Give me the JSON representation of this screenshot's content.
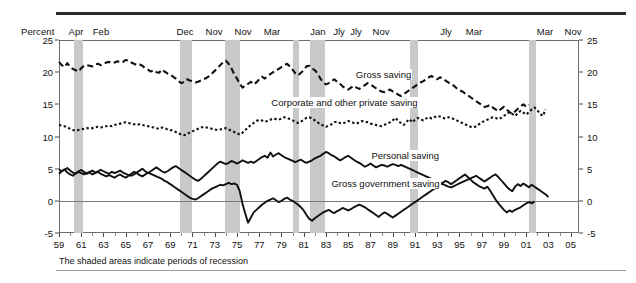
{
  "axis_label": "Percent",
  "footnote": "The shaded areas indicate periods of recession",
  "recession_tags": [
    {
      "label": "Apr",
      "x": 76
    },
    {
      "label": "Feb",
      "x": 101
    },
    {
      "label": "Dec",
      "x": 185
    },
    {
      "label": "Nov",
      "x": 214
    },
    {
      "label": "Nov",
      "x": 243
    },
    {
      "label": "Mar",
      "x": 272
    },
    {
      "label": "Jan",
      "x": 318
    },
    {
      "label": "Jly",
      "x": 339
    },
    {
      "label": "Jly",
      "x": 356
    },
    {
      "label": "Nov",
      "x": 381
    },
    {
      "label": "Jly",
      "x": 446
    },
    {
      "label": "Mar",
      "x": 474
    },
    {
      "label": "Mar",
      "x": 545
    },
    {
      "label": "Nov",
      "x": 573
    }
  ],
  "chart_data": {
    "type": "line",
    "title": "",
    "subtitle": "",
    "xlabel": "",
    "ylabel": "Percent",
    "ylim": [
      -5,
      25
    ],
    "xlim": [
      1959.0,
      2005.75
    ],
    "grid": false,
    "legend_position": "inline-annotations",
    "yticks": [
      -5,
      0,
      5,
      10,
      15,
      20,
      25
    ],
    "ytick_labels": [
      "-5",
      "0",
      "5",
      "10",
      "15",
      "20",
      "25"
    ],
    "xticks": [
      1959,
      1961,
      1963,
      1965,
      1967,
      1969,
      1971,
      1973,
      1975,
      1977,
      1979,
      1981,
      1983,
      1985,
      1987,
      1989,
      1991,
      1993,
      1995,
      1997,
      1999,
      2001,
      2003,
      2005
    ],
    "xtick_labels": [
      "59",
      "61",
      "63",
      "65",
      "67",
      "69",
      "71",
      "73",
      "75",
      "77",
      "79",
      "81",
      "83",
      "85",
      "87",
      "89",
      "91",
      "93",
      "95",
      "97",
      "99",
      "01",
      "03",
      "05"
    ],
    "recessions": [
      {
        "start": 1960.33,
        "end": 1961.12,
        "peak_month": "Apr",
        "trough_month": "Feb"
      },
      {
        "start": 1969.92,
        "end": 1970.92,
        "peak_month": "Dec",
        "trough_month": "Nov"
      },
      {
        "start": 1973.92,
        "end": 1975.25,
        "peak_month": "Nov",
        "trough_month": "Mar"
      },
      {
        "start": 1980.08,
        "end": 1980.58,
        "peak_month": "Jan",
        "trough_month": "Jly"
      },
      {
        "start": 1981.58,
        "end": 1982.92,
        "peak_month": "Jly",
        "trough_month": "Nov"
      },
      {
        "start": 1990.58,
        "end": 1991.25,
        "peak_month": "Jly",
        "trough_month": "Mar"
      },
      {
        "start": 2001.25,
        "end": 2001.92,
        "peak_month": "Mar",
        "trough_month": "Nov"
      }
    ],
    "series": [
      {
        "name": "Gross saving",
        "style": "dashed-long",
        "label_x": 1985.6,
        "label_y": 19.6,
        "x_start": 1959.0,
        "x_step": 0.25,
        "values": [
          21.6,
          21.1,
          20.8,
          21.4,
          20.8,
          20.5,
          20.3,
          20.1,
          20.6,
          21.0,
          21.1,
          21.0,
          20.9,
          21.2,
          21.3,
          21.1,
          21.3,
          21.5,
          21.6,
          21.4,
          21.5,
          21.7,
          21.5,
          21.6,
          21.9,
          21.8,
          21.5,
          21.3,
          21.1,
          21.2,
          21.0,
          20.6,
          20.4,
          20.1,
          20.3,
          20.0,
          19.9,
          20.4,
          20.1,
          19.8,
          19.6,
          19.3,
          19.0,
          18.6,
          18.3,
          18.5,
          18.9,
          18.7,
          18.6,
          18.4,
          18.5,
          18.7,
          18.9,
          19.1,
          19.4,
          19.8,
          20.2,
          20.6,
          21.1,
          21.5,
          21.8,
          21.3,
          20.6,
          19.7,
          19.0,
          18.2,
          17.6,
          17.9,
          18.2,
          18.5,
          18.1,
          18.4,
          18.9,
          19.3,
          19.0,
          19.4,
          19.7,
          20.0,
          20.3,
          20.5,
          20.8,
          21.1,
          21.3,
          20.9,
          20.4,
          19.8,
          19.5,
          19.9,
          20.3,
          20.9,
          21.0,
          20.6,
          20.3,
          19.8,
          19.0,
          18.4,
          18.1,
          18.3,
          18.6,
          18.9,
          18.5,
          18.2,
          17.8,
          17.5,
          17.3,
          17.6,
          17.9,
          17.6,
          17.4,
          17.7,
          18.0,
          18.3,
          18.1,
          17.8,
          17.5,
          17.2,
          17.0,
          16.9,
          17.1,
          17.3,
          17.0,
          16.8,
          16.5,
          16.3,
          16.6,
          16.9,
          17.2,
          17.5,
          17.8,
          18.1,
          18.4,
          18.6,
          18.9,
          19.2,
          19.4,
          19.1,
          18.9,
          19.2,
          19.0,
          18.7,
          18.4,
          18.1,
          17.9,
          17.5,
          17.2,
          17.0,
          16.7,
          16.4,
          16.1,
          15.8,
          15.5,
          15.2,
          14.9,
          14.6,
          14.7,
          14.9,
          14.5,
          14.2,
          13.9,
          14.3,
          14.6,
          14.2,
          13.8,
          13.5,
          13.9,
          14.3,
          14.7,
          15.0,
          14.6,
          14.9
        ]
      },
      {
        "name": "Corporate and other private saving",
        "style": "dotted-short",
        "label_x": 1978.0,
        "label_y": 15.2,
        "x_start": 1959.0,
        "x_step": 0.25,
        "values": [
          11.8,
          11.7,
          11.6,
          11.4,
          11.2,
          11.0,
          10.9,
          11.0,
          11.1,
          11.2,
          11.3,
          11.2,
          11.3,
          11.4,
          11.5,
          11.4,
          11.5,
          11.6,
          11.7,
          11.6,
          11.8,
          11.9,
          12.0,
          12.1,
          12.2,
          12.1,
          12.0,
          11.9,
          11.8,
          11.9,
          11.8,
          11.7,
          11.6,
          11.5,
          11.4,
          11.3,
          11.2,
          11.4,
          11.3,
          11.1,
          11.0,
          10.9,
          10.7,
          10.5,
          10.3,
          10.2,
          10.4,
          10.6,
          10.8,
          11.0,
          11.2,
          11.4,
          11.5,
          11.4,
          11.3,
          11.2,
          11.1,
          11.0,
          11.1,
          11.2,
          11.3,
          11.1,
          10.9,
          10.7,
          10.5,
          10.3,
          10.6,
          11.0,
          11.4,
          11.8,
          12.1,
          12.4,
          12.6,
          12.5,
          12.3,
          12.4,
          12.6,
          12.8,
          12.7,
          12.6,
          12.8,
          13.0,
          12.9,
          12.7,
          12.5,
          12.3,
          12.1,
          12.3,
          12.6,
          12.9,
          13.0,
          12.8,
          12.5,
          12.2,
          11.9,
          11.7,
          11.5,
          11.7,
          11.9,
          12.2,
          12.3,
          12.1,
          12.0,
          12.2,
          12.4,
          12.3,
          12.1,
          12.0,
          12.2,
          12.4,
          12.3,
          12.2,
          12.0,
          11.9,
          11.8,
          11.7,
          11.6,
          11.8,
          12.0,
          12.2,
          12.5,
          12.9,
          12.4,
          12.1,
          11.8,
          12.3,
          12.7,
          12.2,
          12.6,
          12.9,
          12.7,
          12.5,
          12.8,
          13.0,
          12.8,
          13.0,
          13.2,
          13.1,
          12.9,
          12.8,
          13.0,
          12.9,
          12.7,
          12.5,
          12.3,
          12.1,
          11.9,
          11.7,
          11.5,
          11.4,
          11.6,
          11.9,
          12.2,
          12.4,
          12.6,
          12.8,
          13.0,
          12.9,
          12.7,
          12.9,
          13.2,
          13.5,
          13.8,
          13.5,
          13.2,
          13.6,
          14.0,
          13.7,
          13.4,
          13.8,
          14.2,
          14.5,
          14.1,
          13.5,
          13.2,
          14.2
        ]
      },
      {
        "name": "Personal saving",
        "style": "solid",
        "label_x": 1987.0,
        "label_y": 6.9,
        "x_start": 1959.0,
        "x_step": 0.25,
        "values": [
          4.9,
          4.6,
          4.8,
          5.1,
          4.7,
          4.4,
          4.2,
          4.5,
          4.3,
          4.1,
          4.3,
          4.5,
          4.7,
          4.4,
          4.6,
          4.8,
          4.6,
          4.4,
          4.2,
          4.5,
          4.3,
          4.5,
          4.7,
          4.4,
          4.2,
          4.0,
          3.9,
          4.1,
          4.4,
          4.7,
          5.0,
          4.6,
          4.3,
          4.6,
          4.9,
          5.2,
          4.9,
          4.6,
          4.4,
          4.6,
          4.9,
          5.2,
          5.4,
          5.1,
          4.8,
          4.5,
          4.2,
          3.9,
          3.6,
          3.3,
          3.1,
          3.4,
          3.8,
          4.2,
          4.6,
          5.0,
          5.4,
          5.8,
          6.1,
          5.9,
          5.7,
          5.9,
          6.2,
          6.0,
          5.8,
          6.0,
          6.3,
          6.1,
          5.9,
          6.1,
          5.9,
          6.2,
          6.5,
          6.8,
          7.0,
          6.7,
          7.5,
          6.9,
          7.2,
          7.4,
          7.1,
          6.8,
          6.6,
          6.4,
          6.2,
          6.0,
          6.2,
          6.4,
          6.1,
          5.9,
          6.1,
          6.3,
          6.6,
          6.8,
          7.0,
          7.3,
          7.6,
          7.4,
          7.1,
          6.9,
          6.6,
          6.3,
          6.5,
          6.8,
          7.0,
          6.7,
          6.4,
          6.1,
          5.9,
          5.6,
          5.3,
          5.5,
          5.8,
          5.5,
          5.2,
          5.4,
          5.6,
          5.5,
          5.3,
          5.5,
          5.7,
          5.6,
          5.4,
          5.6,
          5.4,
          5.2,
          5.0,
          4.8,
          4.6,
          4.4,
          4.2,
          4.0,
          3.8,
          3.6,
          3.4,
          3.2,
          3.0,
          2.8,
          2.6,
          2.4,
          2.2,
          2.1,
          2.3,
          2.5,
          2.7,
          2.9,
          3.1,
          3.3,
          3.5,
          3.7,
          3.9,
          3.6,
          3.3,
          3.0,
          3.3,
          3.6,
          3.9,
          4.1,
          3.7,
          3.2,
          2.7,
          2.2,
          1.8,
          1.5,
          2.2,
          2.6,
          2.3,
          2.7,
          2.4,
          2.1,
          2.5,
          2.2,
          1.9,
          1.6,
          1.3,
          1.0,
          0.6
        ]
      },
      {
        "name": "Gross government saving",
        "style": "solid",
        "label_x": 1983.4,
        "label_y": 2.6,
        "x_start": 1959.0,
        "x_step": 0.25,
        "values": [
          4.2,
          4.6,
          4.9,
          4.4,
          4.1,
          3.9,
          4.3,
          4.6,
          4.8,
          4.5,
          4.2,
          4.4,
          4.1,
          4.3,
          4.5,
          4.2,
          4.0,
          3.8,
          4.0,
          3.8,
          3.6,
          3.9,
          4.1,
          3.8,
          3.6,
          3.9,
          4.2,
          4.5,
          4.3,
          4.0,
          3.8,
          4.1,
          4.4,
          4.2,
          4.0,
          3.8,
          3.6,
          3.4,
          3.1,
          2.9,
          2.6,
          2.3,
          2.0,
          1.7,
          1.4,
          1.1,
          0.8,
          0.5,
          0.3,
          0.2,
          0.4,
          0.7,
          1.0,
          1.3,
          1.6,
          1.9,
          2.1,
          2.3,
          2.5,
          2.4,
          2.6,
          2.8,
          2.6,
          2.7,
          2.5,
          1.5,
          -0.5,
          -2.0,
          -3.4,
          -2.6,
          -1.8,
          -1.4,
          -1.0,
          -0.6,
          -0.3,
          0.0,
          0.2,
          0.4,
          0.1,
          -0.2,
          0.0,
          0.3,
          0.5,
          0.2,
          0.0,
          -0.3,
          -0.6,
          -1.0,
          -1.5,
          -2.2,
          -2.8,
          -3.1,
          -2.7,
          -2.4,
          -2.1,
          -1.8,
          -1.6,
          -1.4,
          -1.7,
          -1.9,
          -1.6,
          -1.4,
          -1.1,
          -1.3,
          -1.5,
          -1.3,
          -1.0,
          -0.8,
          -0.6,
          -0.8,
          -1.0,
          -1.3,
          -1.6,
          -1.9,
          -2.2,
          -2.5,
          -2.1,
          -1.8,
          -2.0,
          -2.3,
          -2.6,
          -2.3,
          -2.0,
          -1.7,
          -1.4,
          -1.1,
          -0.8,
          -0.5,
          -0.2,
          0.1,
          0.4,
          0.7,
          1.0,
          1.3,
          1.6,
          1.9,
          2.2,
          2.5,
          2.8,
          3.1,
          2.9,
          2.6,
          2.9,
          3.2,
          3.5,
          3.8,
          4.1,
          3.7,
          3.3,
          2.9,
          2.6,
          2.3,
          2.1,
          1.9,
          2.2,
          1.6,
          0.9,
          0.2,
          -0.4,
          -0.9,
          -1.4,
          -1.8,
          -1.5,
          -1.7,
          -1.4,
          -1.2,
          -1.0,
          -0.7,
          -0.4,
          -0.2,
          -0.4,
          -0.1
        ]
      }
    ]
  }
}
